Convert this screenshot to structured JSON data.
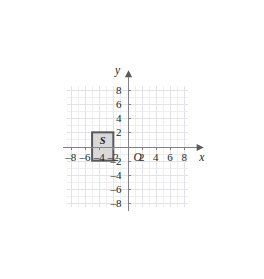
{
  "figure": {
    "background_color": "#ffffff",
    "axis_color": "#808285",
    "grid_minor_color": "#ececf0",
    "grid_major_color": "#e0e0e6",
    "label_color": "#231f20"
  },
  "chart_data": {
    "type": "scatter",
    "title": "",
    "xlabel": "x",
    "ylabel": "y",
    "xlim": [
      -8.5,
      8.5
    ],
    "ylim": [
      -8.5,
      8.5
    ],
    "grid": true,
    "grid_step": 1,
    "legend": "none",
    "origin_label": "O",
    "xticks": [
      -8,
      -6,
      -4,
      -2,
      2,
      4,
      6,
      8
    ],
    "xtick_labels": [
      "–8",
      "–6",
      "–4",
      "–2",
      "2",
      "4",
      "6",
      "8"
    ],
    "yticks": [
      8,
      6,
      4,
      2,
      -2,
      -4,
      -6,
      -8
    ],
    "ytick_labels": [
      "8",
      "6",
      "4",
      "2",
      "–2",
      "–4",
      "–6",
      "–8"
    ],
    "shapes": [
      {
        "name": "S",
        "label": "S",
        "kind": "rectangle",
        "x_min": -5,
        "x_max": -2,
        "y_min": -2,
        "y_max": 2,
        "width": 3,
        "height": 4,
        "vertices": [
          [
            -5,
            2
          ],
          [
            -2,
            2
          ],
          [
            -2,
            -2
          ],
          [
            -5,
            -2
          ]
        ],
        "label_position": [
          -3.5,
          0.8
        ],
        "fill_color": "#d9d9d9",
        "stroke_color": "#58595b"
      }
    ]
  },
  "axes": {
    "x_axis_name": "x",
    "y_axis_name": "y",
    "x_arrow": "right-arrow",
    "y_arrow": "up-arrow"
  }
}
